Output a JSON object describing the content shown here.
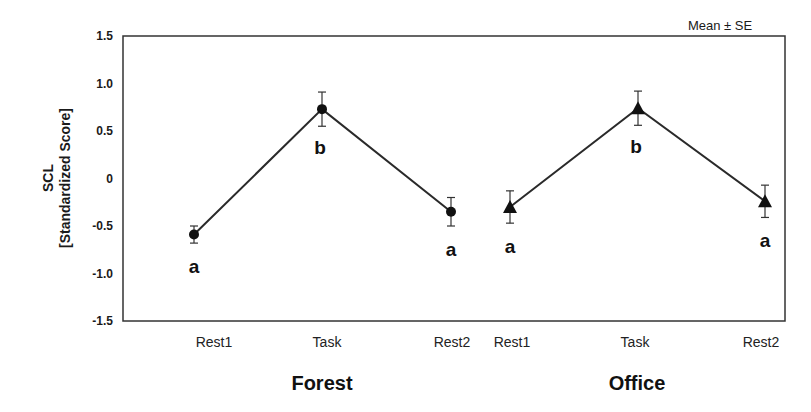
{
  "chart_data": {
    "type": "line",
    "title": "",
    "annotation": "Mean ± SE",
    "ylabel_line1": "SCL",
    "ylabel_line2": "[Standardized Score]",
    "xlabel": "",
    "ylim": [
      -1.5,
      1.5
    ],
    "yticks": [
      1.5,
      1.0,
      0.5,
      0,
      -0.5,
      -1.0,
      -1.5
    ],
    "ytick_labels": [
      "1.5",
      "1.0",
      "0.5",
      "0",
      "-0.5",
      "-1.0",
      "-1.5"
    ],
    "grid": false,
    "legend": null,
    "groups": [
      {
        "name": "Forest",
        "marker": "circle",
        "categories": [
          "Rest1",
          "Task",
          "Rest2"
        ],
        "values": [
          -0.59,
          0.73,
          -0.35
        ],
        "errors": [
          0.09,
          0.18,
          0.15
        ],
        "significance": [
          "a",
          "b",
          "a"
        ]
      },
      {
        "name": "Office",
        "marker": "triangle",
        "categories": [
          "Rest1",
          "Task",
          "Rest2"
        ],
        "values": [
          -0.3,
          0.74,
          -0.24
        ],
        "errors": [
          0.17,
          0.18,
          0.17
        ],
        "significance": [
          "a",
          "b",
          "a"
        ]
      }
    ]
  },
  "colors": {
    "line": "#2a2a2a",
    "marker": "#111111",
    "frame": "#333333"
  }
}
